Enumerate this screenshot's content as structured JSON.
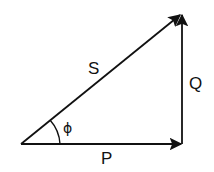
{
  "diagram": {
    "title": "",
    "type": "vector triangle",
    "colors": {
      "stroke": "#111111",
      "background": "#ffffff"
    },
    "vectors": [
      {
        "id": "P",
        "label": "P",
        "from": [
          21,
          144
        ],
        "to": [
          182,
          144
        ],
        "direction": "horizontal-right"
      },
      {
        "id": "Q",
        "label": "Q",
        "from": [
          182,
          144
        ],
        "to": [
          182,
          13
        ],
        "direction": "vertical-up"
      },
      {
        "id": "S",
        "label": "S",
        "from": [
          21,
          144
        ],
        "to": [
          182,
          13
        ],
        "direction": "diagonal-up-right"
      }
    ],
    "angle": {
      "label": "ϕ",
      "vertex": [
        21,
        144
      ],
      "between": [
        "P",
        "S"
      ]
    },
    "labels": {
      "S": "S",
      "Q": "Q",
      "P": "P",
      "phi": "ϕ"
    }
  }
}
